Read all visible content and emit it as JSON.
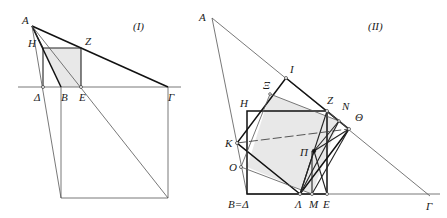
{
  "figures": [
    {
      "id": "I",
      "title": "(I)",
      "labels": {
        "A": "A",
        "H": "H",
        "Z": "Z",
        "Delta": "Δ",
        "B": "B",
        "E": "E",
        "Gamma": "Γ"
      },
      "points": {
        "A": [
          32,
          26
        ],
        "H": [
          36,
          38
        ],
        "Z": [
          81,
          48
        ],
        "Delta": [
          43,
          87
        ],
        "B": [
          61,
          87
        ],
        "E": [
          81,
          87
        ],
        "Gamma": [
          168,
          87
        ],
        "SqTL": [
          43,
          48
        ],
        "BotL": [
          61,
          198
        ],
        "BotR": [
          168,
          198
        ]
      }
    },
    {
      "id": "II",
      "title": "(II)",
      "labels": {
        "A": "A",
        "I": "I",
        "Xi": "Ξ",
        "H": "H",
        "Z": "Z",
        "N": "N",
        "Theta": "Θ",
        "K": "K",
        "Pi": "Π",
        "O": "O",
        "BDelta": "B=Δ",
        "Lambda": "Λ",
        "M": "M",
        "E": "E",
        "Gamma": "Γ"
      },
      "points": {
        "A": [
          212,
          18
        ],
        "I": [
          286,
          78
        ],
        "Xi": [
          270,
          94
        ],
        "Z": [
          327,
          111
        ],
        "N": [
          339,
          121
        ],
        "Theta": [
          349,
          129
        ],
        "K": [
          237,
          143
        ],
        "Pi": [
          314,
          151
        ],
        "O": [
          241,
          167
        ],
        "BDelta": [
          247,
          194
        ],
        "Lambda": [
          300,
          194
        ],
        "M": [
          312,
          194
        ],
        "E": [
          327,
          194
        ],
        "Gamma": [
          430,
          196
        ]
      }
    }
  ],
  "colors": {
    "line": "#111111",
    "shade": "#e8e8e8",
    "thin": "#555555"
  }
}
